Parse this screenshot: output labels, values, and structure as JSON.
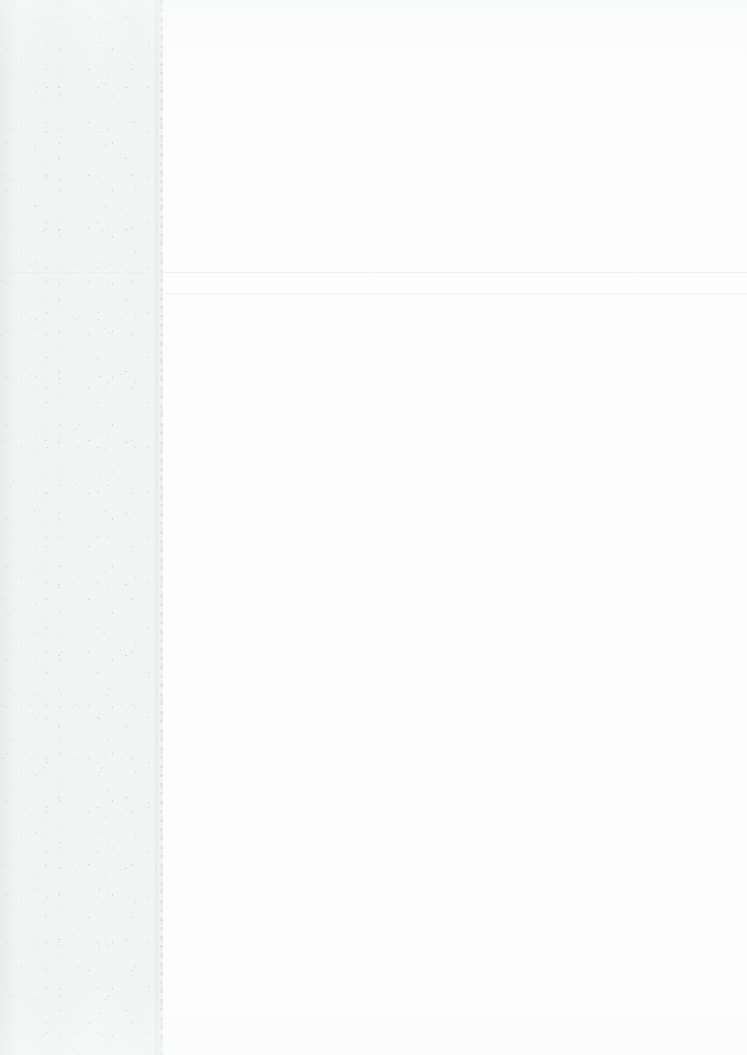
{
  "document": {
    "kind": "scanned-page",
    "condition": "faded",
    "page_width": 747,
    "page_height": 1055,
    "background_color": "#fdfdfd"
  },
  "margin_column": {
    "label": "scanned left margin",
    "width": 163,
    "color": "#f3f4f4",
    "edge_color": "#e2e4e4"
  },
  "rules": {
    "top_rule_label": "horizontal rule",
    "body_rule_label": "horizontal rule",
    "color": "#eceded"
  },
  "ghost_text": {
    "header_left": "· ······ ·· · ··",
    "header_right": "·· ····",
    "mid_a": "· ·· ·",
    "mid_b": "·· ·",
    "mid_c": "·· ·",
    "footer": "· ·· ····· ···· ·"
  }
}
